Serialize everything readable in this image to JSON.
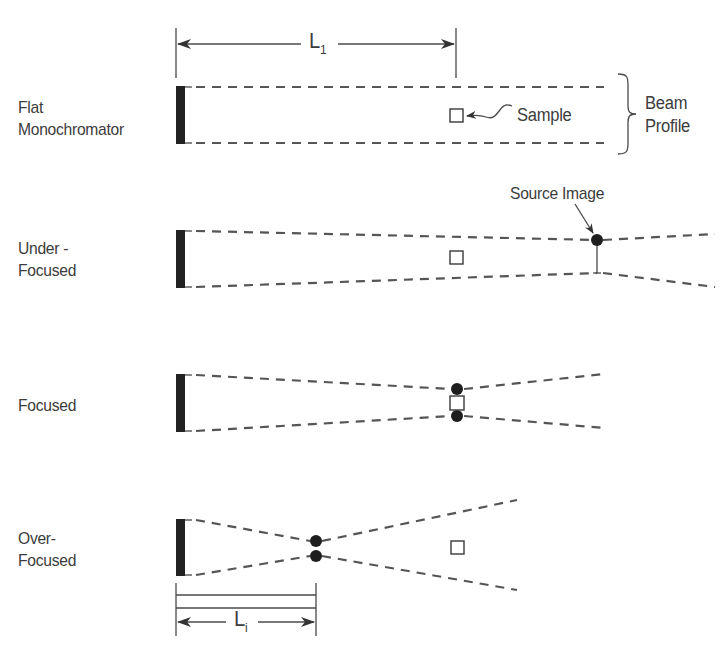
{
  "diagram": {
    "title_labels": {
      "L1": {
        "main": "L",
        "sub": "1"
      },
      "Li": {
        "main": "L",
        "sub": "i"
      }
    },
    "rows": [
      {
        "id": "flat",
        "label": "Flat\nMonochromator"
      },
      {
        "id": "under",
        "label": "Under -\nFocused"
      },
      {
        "id": "focused",
        "label": "Focused"
      },
      {
        "id": "over",
        "label": "Over-\nFocused"
      }
    ],
    "annotations": {
      "sample": "Sample",
      "beam_profile": "Beam\nProfile",
      "source_image": "Source Image"
    },
    "colors": {
      "line": "#555555",
      "monochromator": "#222222",
      "focus_dot": "#1e1e1e"
    }
  }
}
